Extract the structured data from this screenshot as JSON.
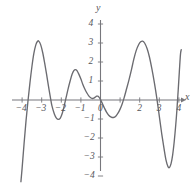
{
  "chart_data": {
    "type": "line",
    "title": "",
    "subtitle": "",
    "xlabel": "x",
    "ylabel": "y",
    "xlim": [
      -4.2,
      4.2
    ],
    "ylim": [
      -4.2,
      4.4
    ],
    "grid": false,
    "legend": null,
    "x_ticks": [
      -4,
      -3,
      -2,
      -1,
      0,
      1,
      2,
      3,
      4
    ],
    "x_tick_labels": [
      "-4",
      "-3",
      "-2",
      "-1",
      "0",
      "2",
      "3",
      "4"
    ],
    "y_ticks": [
      -4,
      -3,
      -2,
      -1,
      1,
      2,
      3,
      4
    ],
    "y_tick_labels": [
      "4",
      "3",
      "2",
      "1",
      "-1",
      "-2",
      "-3",
      "-4"
    ],
    "series": [
      {
        "name": "curve",
        "color": "#6b6b70",
        "points": [
          [
            -4.06,
            -4.3
          ],
          [
            -4.0,
            -3.6
          ],
          [
            -3.9,
            -2.3
          ],
          [
            -3.8,
            -1.1
          ],
          [
            -3.7,
            -0.05
          ],
          [
            -3.6,
            0.9
          ],
          [
            -3.5,
            1.75
          ],
          [
            -3.4,
            2.45
          ],
          [
            -3.3,
            2.9
          ],
          [
            -3.22,
            3.08
          ],
          [
            -3.15,
            3.1
          ],
          [
            -3.05,
            2.9
          ],
          [
            -2.95,
            2.5
          ],
          [
            -2.85,
            1.95
          ],
          [
            -2.75,
            1.35
          ],
          [
            -2.65,
            0.7
          ],
          [
            -2.55,
            0.1
          ],
          [
            -2.48,
            -0.3
          ],
          [
            -2.35,
            -0.75
          ],
          [
            -2.25,
            -0.95
          ],
          [
            -2.15,
            -1.02
          ],
          [
            -2.05,
            -0.95
          ],
          [
            -1.95,
            -0.7
          ],
          [
            -1.85,
            -0.3
          ],
          [
            -1.75,
            0.15
          ],
          [
            -1.65,
            0.6
          ],
          [
            -1.55,
            1.0
          ],
          [
            -1.45,
            1.35
          ],
          [
            -1.36,
            1.55
          ],
          [
            -1.28,
            1.6
          ],
          [
            -1.2,
            1.55
          ],
          [
            -1.1,
            1.35
          ],
          [
            -1.0,
            1.1
          ],
          [
            -0.9,
            0.82
          ],
          [
            -0.8,
            0.58
          ],
          [
            -0.7,
            0.38
          ],
          [
            -0.6,
            0.22
          ],
          [
            -0.5,
            0.12
          ],
          [
            -0.42,
            0.08
          ],
          [
            -0.34,
            0.1
          ],
          [
            -0.26,
            0.16
          ],
          [
            -0.2,
            0.2
          ],
          [
            -0.14,
            0.2
          ],
          [
            -0.07,
            0.14
          ],
          [
            0.0,
            0.02
          ],
          [
            0.1,
            -0.2
          ],
          [
            0.2,
            -0.42
          ],
          [
            0.3,
            -0.62
          ],
          [
            0.42,
            -0.8
          ],
          [
            0.55,
            -0.9
          ],
          [
            0.66,
            -0.92
          ],
          [
            0.78,
            -0.85
          ],
          [
            0.9,
            -0.68
          ],
          [
            1.0,
            -0.48
          ],
          [
            1.1,
            -0.22
          ],
          [
            1.2,
            0.1
          ],
          [
            1.32,
            0.55
          ],
          [
            1.45,
            1.05
          ],
          [
            1.58,
            1.6
          ],
          [
            1.7,
            2.15
          ],
          [
            1.82,
            2.6
          ],
          [
            1.95,
            2.92
          ],
          [
            2.05,
            3.06
          ],
          [
            2.15,
            3.1
          ],
          [
            2.25,
            3.0
          ],
          [
            2.38,
            2.7
          ],
          [
            2.5,
            2.25
          ],
          [
            2.62,
            1.65
          ],
          [
            2.75,
            0.9
          ],
          [
            2.88,
            0.05
          ],
          [
            3.0,
            -0.85
          ],
          [
            3.12,
            -1.75
          ],
          [
            3.24,
            -2.55
          ],
          [
            3.34,
            -3.15
          ],
          [
            3.44,
            -3.5
          ],
          [
            3.52,
            -3.55
          ],
          [
            3.6,
            -3.35
          ],
          [
            3.68,
            -2.9
          ],
          [
            3.76,
            -2.2
          ],
          [
            3.84,
            -1.3
          ],
          [
            3.9,
            -0.5
          ],
          [
            3.96,
            0.45
          ],
          [
            4.02,
            1.45
          ],
          [
            4.08,
            2.4
          ],
          [
            4.12,
            2.65
          ]
        ]
      }
    ]
  },
  "axes": {
    "x_axis_name": "x",
    "y_axis_name": "y"
  }
}
